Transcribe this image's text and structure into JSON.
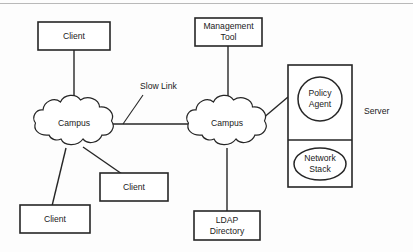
{
  "diagram": {
    "top_rule_visible": true,
    "colors": {
      "stroke": "#262626",
      "fill": "#ffffff",
      "background": "#fdfdfd",
      "rule": "#b9b9b9"
    },
    "nodes": {
      "client_top": {
        "label": "Client",
        "shape": "rectangle"
      },
      "client_middle": {
        "label": "Client",
        "shape": "rectangle"
      },
      "client_bottom": {
        "label": "Client",
        "shape": "rectangle"
      },
      "campus_left": {
        "label": "Campus",
        "shape": "cloud"
      },
      "campus_right": {
        "label": "Campus",
        "shape": "cloud"
      },
      "management_tool": {
        "label_line1": "Management",
        "label_line2": "Tool",
        "shape": "rectangle"
      },
      "ldap_directory": {
        "label_line1": "LDAP",
        "label_line2": "Directory",
        "shape": "rectangle"
      },
      "server": {
        "label": "Server",
        "shape": "rectangle-split"
      },
      "policy_agent": {
        "label_line1": "Policy",
        "label_line2": "Agent",
        "shape": "circle"
      },
      "network_stack": {
        "label_line1": "Network",
        "label_line2": "Stack",
        "shape": "ellipse"
      }
    },
    "annotations": {
      "slow_link": {
        "label": "Slow Link"
      }
    },
    "edges": [
      {
        "name": "client-top-to-campus-left",
        "from": "client_top",
        "to": "campus_left"
      },
      {
        "name": "campus-left-to-campus-right",
        "from": "campus_left",
        "to": "campus_right"
      },
      {
        "name": "campus-left-to-client-bottom",
        "from": "campus_left",
        "to": "client_bottom"
      },
      {
        "name": "campus-left-to-client-middle",
        "from": "campus_left",
        "to": "client_middle"
      },
      {
        "name": "management-tool-to-campus-right",
        "from": "management_tool",
        "to": "campus_right"
      },
      {
        "name": "campus-right-to-ldap-directory",
        "from": "campus_right",
        "to": "ldap_directory"
      },
      {
        "name": "campus-right-to-server",
        "from": "campus_right",
        "to": "server"
      }
    ]
  }
}
